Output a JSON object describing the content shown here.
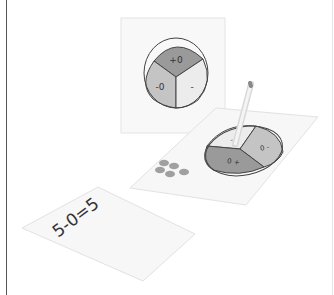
{
  "illustration": {
    "top_card": {
      "spinner_sections": [
        {
          "label": "+0",
          "color": "#9a9a9a"
        },
        {
          "label": "-0",
          "color": "#c4c4c4"
        },
        {
          "label": "-",
          "color": "#ececec"
        }
      ]
    },
    "middle_card": {
      "spinner_sections": [
        {
          "label": "-",
          "color": "#ececec"
        },
        {
          "label": "0 -",
          "color": "#c4c4c4"
        },
        {
          "label": "0 +",
          "color": "#9a9a9a"
        }
      ],
      "dot_count": 5,
      "dot_color": "#a0a0a0",
      "pencil": "pencil-icon"
    },
    "bottom_card": {
      "equation": "5-0=5"
    }
  },
  "colors": {
    "card_fill": "#f7f7f7",
    "card_edge": "#e2e2e2",
    "outline": "#444444"
  }
}
